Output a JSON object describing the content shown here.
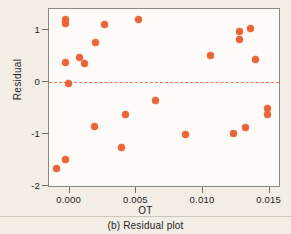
{
  "figure": {
    "caption": "(b) Residual plot",
    "background_color": "#f3ede5",
    "plot_background_color": "#fdfbf7",
    "point_color": "#ec6338",
    "reference_line_color": "#e8795a",
    "axis_color": "#6f6a63"
  },
  "chart_data": {
    "type": "scatter",
    "title": "",
    "subtitle": "",
    "xlabel": "OT",
    "ylabel": "Residual",
    "xlim": [
      -0.00155,
      0.01585
    ],
    "ylim": [
      -2.03,
      1.4
    ],
    "xticks": [
      0.0,
      0.005,
      0.01,
      0.015
    ],
    "xtick_labels": [
      "0.000",
      "0.005",
      "0.010",
      "0.015"
    ],
    "yticks": [
      1,
      0,
      -1,
      -2
    ],
    "ytick_labels": [
      "1",
      "0",
      "-1",
      "-2"
    ],
    "grid": false,
    "legend": "none",
    "annotations": [
      {
        "kind": "reference-line",
        "orientation": "horizontal",
        "value": 0,
        "style": "dashed",
        "color": "#e8795a"
      }
    ],
    "series": [
      {
        "name": "Residuals",
        "marker": "circle",
        "color": "#ec6338",
        "x": [
          -0.00096,
          -0.00035,
          -0.00035,
          -0.0003,
          0.0004,
          0.0007,
          0.00105,
          0.00113,
          0.00185,
          0.0026,
          0.0039,
          0.00515,
          0.0064,
          0.00725,
          0.0087,
          0.01055,
          0.0123,
          0.01255,
          0.01275,
          0.0128,
          0.01315,
          0.01355,
          0.0139,
          0.01455,
          0.01485,
          0.01485,
          -0.0001,
          0.00195
        ],
        "y": [
          -1.66,
          -1.49,
          0.37,
          1.2,
          1.13,
          0.47,
          0.35,
          0.35,
          -0.86,
          1.11,
          -1.25,
          1.19,
          -0.36,
          -0.63,
          -1.0,
          0.5,
          -0.98,
          0.97,
          0.81,
          0.97,
          -0.88,
          1.02,
          0.43,
          -0.51,
          -0.63,
          -0.51,
          -0.02,
          0.76
        ],
        "points": [
          {
            "x": -0.00096,
            "y": -1.66
          },
          {
            "x": -0.00035,
            "y": -1.49
          },
          {
            "x": -0.00035,
            "y": 0.37
          },
          {
            "x": -0.0003,
            "y": 1.2
          },
          {
            "x": -0.0003,
            "y": 1.13
          },
          {
            "x": -0.0001,
            "y": -0.02
          },
          {
            "x": 0.0007,
            "y": 0.47
          },
          {
            "x": 0.00113,
            "y": 0.35
          },
          {
            "x": 0.00185,
            "y": -0.86
          },
          {
            "x": 0.00195,
            "y": 0.76
          },
          {
            "x": 0.0026,
            "y": 1.11
          },
          {
            "x": 0.0039,
            "y": -1.25
          },
          {
            "x": 0.0042,
            "y": -0.63
          },
          {
            "x": 0.00515,
            "y": 1.19
          },
          {
            "x": 0.0064,
            "y": -0.36
          },
          {
            "x": 0.0087,
            "y": -1.0
          },
          {
            "x": 0.01055,
            "y": 0.5
          },
          {
            "x": 0.0123,
            "y": -0.98
          },
          {
            "x": 0.01275,
            "y": 0.97
          },
          {
            "x": 0.01275,
            "y": 0.81
          },
          {
            "x": 0.01315,
            "y": -0.88
          },
          {
            "x": 0.01355,
            "y": 1.02
          },
          {
            "x": 0.0139,
            "y": 0.43
          },
          {
            "x": 0.0148,
            "y": -0.51
          },
          {
            "x": 0.0148,
            "y": -0.63
          }
        ]
      }
    ]
  }
}
